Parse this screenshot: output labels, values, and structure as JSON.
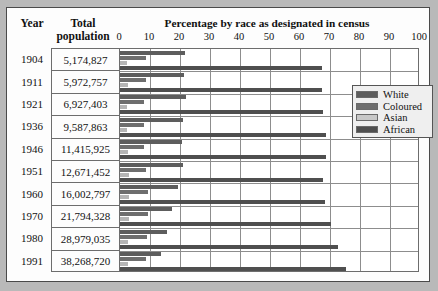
{
  "header": {
    "year_label": "Year",
    "population_label_line1": "Total",
    "population_label_line2": "population",
    "chart_title": "Percentage by race as designated in census"
  },
  "legend": {
    "position": "right",
    "items": [
      {
        "label": "White",
        "color": "#5d5d5d",
        "key": "white"
      },
      {
        "label": "Coloured",
        "color": "#6e6e6e",
        "key": "coloured"
      },
      {
        "label": "Asian",
        "color": "#c8c8c8",
        "key": "asian"
      },
      {
        "label": "African",
        "color": "#4f4f4f",
        "key": "african"
      }
    ]
  },
  "table": {
    "columns": [
      "Year",
      "Total population"
    ],
    "rows": [
      {
        "year": "1904",
        "population": "5,174,827"
      },
      {
        "year": "1911",
        "population": "5,972,757"
      },
      {
        "year": "1921",
        "population": "6,927,403"
      },
      {
        "year": "1936",
        "population": "9,587,863"
      },
      {
        "year": "1946",
        "population": "11,415,925"
      },
      {
        "year": "1951",
        "population": "12,671,452"
      },
      {
        "year": "1960",
        "population": "16,002,797"
      },
      {
        "year": "1970",
        "population": "21,794,328"
      },
      {
        "year": "1980",
        "population": "28,979,035"
      },
      {
        "year": "1991",
        "population": "38,268,720"
      }
    ]
  },
  "chart_data": {
    "type": "bar",
    "orientation": "horizontal",
    "title": "Percentage by race as designated in census",
    "xlabel": "",
    "ylabel": "Year",
    "xlim": [
      0,
      100
    ],
    "xticks": [
      0,
      10,
      20,
      30,
      40,
      50,
      60,
      70,
      80,
      90,
      100
    ],
    "grid": true,
    "legend_entries": [
      "White",
      "Coloured",
      "Asian",
      "African"
    ],
    "categories": [
      "1904",
      "1911",
      "1921",
      "1936",
      "1946",
      "1951",
      "1960",
      "1970",
      "1980",
      "1991"
    ],
    "series": [
      {
        "name": "White",
        "color": "#5d5d5d",
        "values": [
          21.6,
          21.4,
          22.0,
          20.9,
          20.8,
          20.9,
          19.3,
          17.3,
          15.5,
          13.6
        ]
      },
      {
        "name": "Coloured",
        "color": "#6e6e6e",
        "values": [
          8.6,
          8.8,
          7.9,
          8.0,
          8.1,
          8.7,
          9.4,
          9.4,
          9.1,
          8.6
        ]
      },
      {
        "name": "Asian",
        "color": "#b5b5b5",
        "values": [
          2.4,
          2.6,
          2.4,
          2.3,
          2.5,
          2.9,
          3.0,
          2.9,
          2.8,
          2.6
        ]
      },
      {
        "name": "African",
        "color": "#4f4f4f",
        "values": [
          67.4,
          67.2,
          67.7,
          68.8,
          68.6,
          67.5,
          68.3,
          70.4,
          72.6,
          75.2
        ]
      }
    ]
  }
}
